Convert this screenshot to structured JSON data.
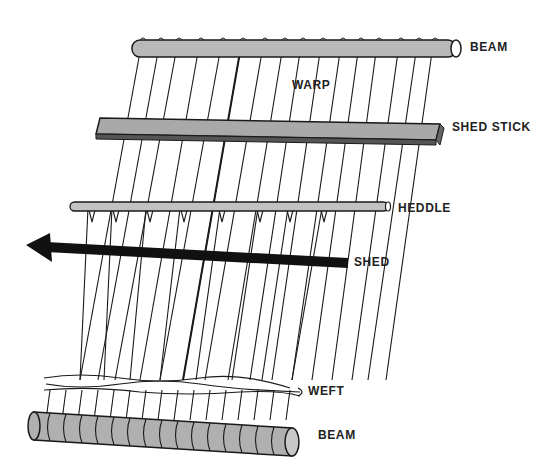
{
  "diagram": {
    "type": "loom-illustration",
    "colors": {
      "ink": "#1a1a1a",
      "rod_fill": "#b8b8b8",
      "stick_fill": "#a9a9a9",
      "background": "#ffffff"
    },
    "labels": {
      "top_beam": "BEAM",
      "warp": "WARP",
      "shed_stick": "SHED STICK",
      "heddle": "HEDDLE",
      "shed": "SHED",
      "weft": "WEFT",
      "bottom_beam": "BEAM"
    },
    "components": [
      {
        "id": "top-beam",
        "label": "BEAM",
        "shape": "cylinder"
      },
      {
        "id": "warp",
        "label": "WARP",
        "shape": "threads",
        "count": 16
      },
      {
        "id": "shed-stick",
        "label": "SHED STICK",
        "shape": "flat-bar"
      },
      {
        "id": "heddle",
        "label": "HEDDLE",
        "shape": "thin-rod",
        "loops": 8
      },
      {
        "id": "shed",
        "label": "SHED",
        "shape": "arrow-left"
      },
      {
        "id": "weft",
        "label": "WEFT",
        "shape": "woven-thread"
      },
      {
        "id": "bottom-beam",
        "label": "BEAM",
        "shape": "cylinder"
      }
    ]
  }
}
